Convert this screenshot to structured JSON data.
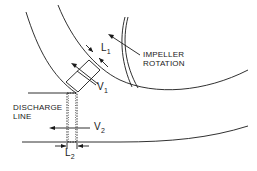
{
  "diagram": {
    "colors": {
      "stroke": "#1a1a1a",
      "background": "#ffffff"
    },
    "labels": {
      "impeller_rotation": {
        "line1": "IMPELLER",
        "line2": "ROTATION"
      },
      "discharge_line": {
        "line1": "DISCHARGE",
        "line2": "LINE"
      },
      "L1": {
        "base": "L",
        "sub": "1"
      },
      "V1": {
        "base": "V",
        "sub": "1"
      },
      "V2": {
        "base": "V",
        "sub": "2"
      },
      "L2": {
        "base": "L",
        "sub": "2"
      }
    }
  }
}
